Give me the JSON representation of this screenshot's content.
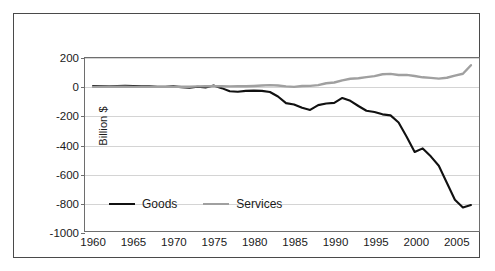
{
  "chart_data": {
    "type": "line",
    "title": "",
    "subtitle": "",
    "xlabel": "",
    "ylabel": "Billion $",
    "xlim": [
      1959,
      2008
    ],
    "ylim": [
      -1000,
      200
    ],
    "ytick_values": [
      200,
      0,
      -200,
      -400,
      -600,
      -800,
      -1000
    ],
    "ytick_labels": [
      "200",
      "0",
      "-200",
      "-400",
      "-600",
      "-800",
      "-1000"
    ],
    "xtick_values": [
      1960,
      1965,
      1970,
      1975,
      1980,
      1985,
      1990,
      1995,
      2000,
      2005
    ],
    "xtick_labels": [
      "1960",
      "1965",
      "1970",
      "1975",
      "1980",
      "1985",
      "1990",
      "1995",
      "2000",
      "2005"
    ],
    "grid": "horizontal",
    "legend_position": "inside-bottom-left",
    "x": [
      1960,
      1961,
      1962,
      1963,
      1964,
      1965,
      1966,
      1967,
      1968,
      1969,
      1970,
      1971,
      1972,
      1973,
      1974,
      1975,
      1976,
      1977,
      1978,
      1979,
      1980,
      1981,
      1982,
      1983,
      1984,
      1985,
      1986,
      1987,
      1988,
      1989,
      1990,
      1991,
      1992,
      1993,
      1994,
      1995,
      1996,
      1997,
      1998,
      1999,
      2000,
      2001,
      2002,
      2003,
      2004,
      2005,
      2006,
      2007
    ],
    "series": [
      {
        "name": "Goods",
        "color": "#111111",
        "line_width": 2.1,
        "values": [
          5,
          6,
          4,
          5,
          7,
          5,
          4,
          4,
          1,
          1,
          3,
          -2,
          -6,
          1,
          -5,
          9,
          -9,
          -31,
          -34,
          -28,
          -26,
          -28,
          -36,
          -67,
          -113,
          -122,
          -145,
          -160,
          -127,
          -116,
          -111,
          -77,
          -97,
          -133,
          -166,
          -174,
          -191,
          -198,
          -247,
          -346,
          -452,
          -427,
          -482,
          -547,
          -665,
          -783,
          -837,
          -820
        ]
      },
      {
        "name": "Services",
        "color": "#a0a0a0",
        "line_width": 2.4,
        "values": [
          0,
          1,
          1,
          1,
          1,
          0,
          0,
          0,
          0,
          0,
          0,
          1,
          1,
          3,
          5,
          4,
          4,
          3,
          4,
          4,
          6,
          9,
          12,
          9,
          3,
          0,
          6,
          7,
          12,
          25,
          30,
          45,
          56,
          60,
          67,
          74,
          87,
          90,
          82,
          83,
          75,
          66,
          62,
          57,
          63,
          78,
          91,
          150
        ]
      }
    ]
  },
  "legend": {
    "items": [
      {
        "label": "Goods",
        "color": "#111111"
      },
      {
        "label": "Services",
        "color": "#a0a0a0"
      }
    ]
  }
}
